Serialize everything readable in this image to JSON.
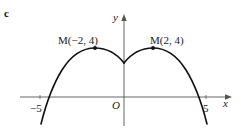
{
  "figure": {
    "part_label": "c",
    "axes": {
      "x_label": "x",
      "y_label": "y",
      "origin_label": "O",
      "x_ticks": [
        {
          "value": -5,
          "label": "−5"
        },
        {
          "value": 5,
          "label": "5"
        }
      ]
    },
    "points": [
      {
        "name": "M",
        "x": -2,
        "y": 4,
        "label": "M(−2, 4)"
      },
      {
        "name": "M",
        "x": 2,
        "y": 4,
        "label": "M(2, 4)"
      }
    ],
    "curve": {
      "description": "Symmetric curve with maxima at M(-2, 4) and M(2, 4), a cusp on the y-axis, crossing the x-axis just inside -5 and 5",
      "color": "#111111"
    }
  }
}
